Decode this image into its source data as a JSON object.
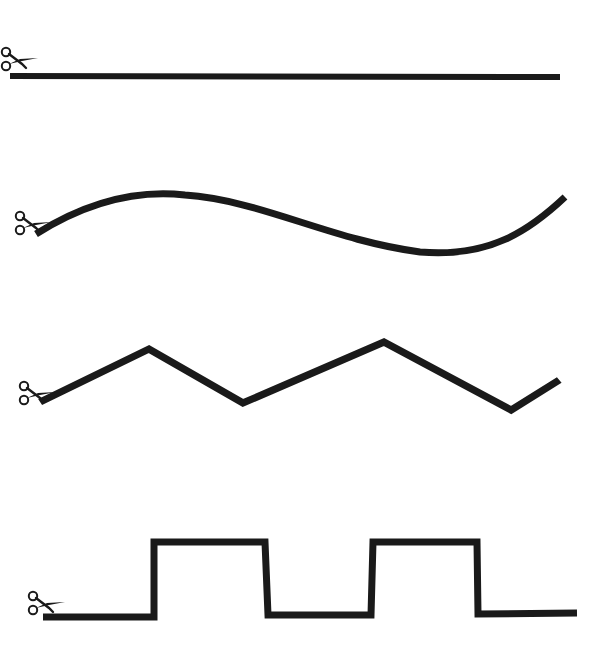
{
  "worksheet": {
    "background": "#ffffff",
    "line_color": "#1a1a1a",
    "line_width": 7,
    "rows": [
      {
        "id": "straight",
        "shape": "straight-line",
        "icon": "scissors-icon"
      },
      {
        "id": "curve",
        "shape": "curved-wave",
        "icon": "scissors-icon"
      },
      {
        "id": "zigzag",
        "shape": "zigzag",
        "icon": "scissors-icon"
      },
      {
        "id": "square",
        "shape": "square-wave",
        "icon": "scissors-icon"
      }
    ]
  }
}
